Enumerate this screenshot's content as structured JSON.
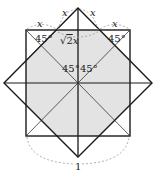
{
  "figure": {
    "type": "geometry-diagram",
    "colors": {
      "stroke": "#1a1a1a",
      "shade": "#e3e3e3",
      "dashed": "#999999"
    },
    "labels": {
      "x_top_left": "x",
      "x_top_right": "x",
      "x_left": "x",
      "x_right": "x",
      "angle_top_left": "45°",
      "angle_top_right": "45°",
      "sqrt2x": "√2x",
      "sqrt2x_root": "√",
      "sqrt2x_body": "2",
      "sqrt2x_var": "x",
      "angle_center_left": "45°",
      "angle_center_right": "45°",
      "bottom": "1"
    }
  }
}
